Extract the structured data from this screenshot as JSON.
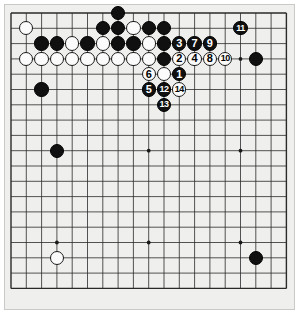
{
  "diagram": {
    "type": "go-board-diagram",
    "board_size": 19,
    "geometry": {
      "origin_x": 11,
      "origin_y": 13,
      "spacing": 15.3,
      "stone_diameter": 14.4,
      "board_left": 4,
      "board_top": 4,
      "board_width": 291,
      "board_height": 306
    },
    "colors": {
      "board_background": "#efefed",
      "board_border": "#c9c9c6",
      "grid_line": "#2a2a2a",
      "star_point": "#1a1a1a",
      "black_stone": "#101010",
      "white_stone": "#fbfbfb",
      "black_label_text": "#ffffff",
      "white_label_text": "#000000",
      "page_background": "#ffffff"
    },
    "star_points": [
      {
        "col": 3,
        "row": 3
      },
      {
        "col": 9,
        "row": 3
      },
      {
        "col": 15,
        "row": 3
      },
      {
        "col": 3,
        "row": 9
      },
      {
        "col": 9,
        "row": 9
      },
      {
        "col": 15,
        "row": 9
      },
      {
        "col": 3,
        "row": 15
      },
      {
        "col": 9,
        "row": 15
      },
      {
        "col": 15,
        "row": 15
      }
    ],
    "stones": [
      {
        "col": 1,
        "row": 1,
        "color": "white",
        "label": ""
      },
      {
        "col": 7,
        "row": 0,
        "color": "black",
        "label": ""
      },
      {
        "col": 6,
        "row": 1,
        "color": "black",
        "label": ""
      },
      {
        "col": 7,
        "row": 1,
        "color": "black",
        "label": ""
      },
      {
        "col": 8,
        "row": 1,
        "color": "white",
        "label": ""
      },
      {
        "col": 9,
        "row": 1,
        "color": "black",
        "label": ""
      },
      {
        "col": 10,
        "row": 1,
        "color": "black",
        "label": ""
      },
      {
        "col": 2,
        "row": 2,
        "color": "black",
        "label": ""
      },
      {
        "col": 3,
        "row": 2,
        "color": "black",
        "label": ""
      },
      {
        "col": 4,
        "row": 2,
        "color": "white",
        "label": ""
      },
      {
        "col": 5,
        "row": 2,
        "color": "black",
        "label": ""
      },
      {
        "col": 6,
        "row": 2,
        "color": "white",
        "label": ""
      },
      {
        "col": 7,
        "row": 2,
        "color": "black",
        "label": ""
      },
      {
        "col": 8,
        "row": 2,
        "color": "black",
        "label": ""
      },
      {
        "col": 9,
        "row": 2,
        "color": "white",
        "label": ""
      },
      {
        "col": 10,
        "row": 2,
        "color": "black",
        "label": ""
      },
      {
        "col": 11,
        "row": 2,
        "color": "black",
        "label": "3"
      },
      {
        "col": 12,
        "row": 2,
        "color": "black",
        "label": "7"
      },
      {
        "col": 13,
        "row": 2,
        "color": "black",
        "label": "9"
      },
      {
        "col": 1,
        "row": 3,
        "color": "white",
        "label": ""
      },
      {
        "col": 2,
        "row": 3,
        "color": "white",
        "label": ""
      },
      {
        "col": 3,
        "row": 3,
        "color": "white",
        "label": ""
      },
      {
        "col": 4,
        "row": 3,
        "color": "white",
        "label": ""
      },
      {
        "col": 5,
        "row": 3,
        "color": "white",
        "label": ""
      },
      {
        "col": 6,
        "row": 3,
        "color": "white",
        "label": ""
      },
      {
        "col": 7,
        "row": 3,
        "color": "white",
        "label": ""
      },
      {
        "col": 8,
        "row": 3,
        "color": "white",
        "label": ""
      },
      {
        "col": 9,
        "row": 3,
        "color": "white",
        "label": ""
      },
      {
        "col": 10,
        "row": 3,
        "color": "black",
        "label": ""
      },
      {
        "col": 11,
        "row": 3,
        "color": "white",
        "label": "2"
      },
      {
        "col": 12,
        "row": 3,
        "color": "white",
        "label": "4"
      },
      {
        "col": 13,
        "row": 3,
        "color": "white",
        "label": "8"
      },
      {
        "col": 14,
        "row": 3,
        "color": "white",
        "label": "10"
      },
      {
        "col": 16,
        "row": 3,
        "color": "black",
        "label": ""
      },
      {
        "col": 15,
        "row": 1,
        "color": "black",
        "label": "11"
      },
      {
        "col": 9,
        "row": 4,
        "color": "white",
        "label": "6"
      },
      {
        "col": 10,
        "row": 4,
        "color": "white",
        "label": ""
      },
      {
        "col": 11,
        "row": 4,
        "color": "black",
        "label": "1"
      },
      {
        "col": 9,
        "row": 5,
        "color": "black",
        "label": "5"
      },
      {
        "col": 10,
        "row": 5,
        "color": "black",
        "label": "12"
      },
      {
        "col": 11,
        "row": 5,
        "color": "white",
        "label": "14"
      },
      {
        "col": 10,
        "row": 6,
        "color": "black",
        "label": "13"
      },
      {
        "col": 2,
        "row": 5,
        "color": "black",
        "label": ""
      },
      {
        "col": 3,
        "row": 9,
        "color": "black",
        "label": ""
      },
      {
        "col": 3,
        "row": 16,
        "color": "white",
        "label": ""
      },
      {
        "col": 16,
        "row": 16,
        "color": "black",
        "label": ""
      }
    ]
  }
}
